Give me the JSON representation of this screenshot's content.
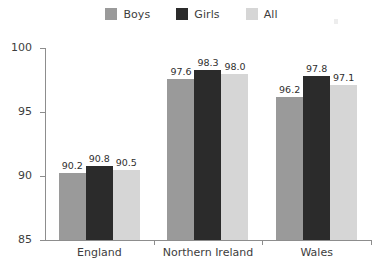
{
  "chart_data": {
    "type": "bar",
    "title": "",
    "subtitle": "",
    "xlabel": "",
    "ylabel": "",
    "categories": [
      "England",
      "Northern Ireland",
      "Wales"
    ],
    "series": [
      {
        "name": "Boys",
        "color": "#9a9a9a",
        "values": [
          90.2,
          97.6,
          96.2
        ]
      },
      {
        "name": "Girls",
        "color": "#2b2b2b",
        "values": [
          90.8,
          98.3,
          97.8
        ]
      },
      {
        "name": "All",
        "color": "#d6d6d6",
        "values": [
          90.5,
          98.0,
          97.1
        ]
      }
    ],
    "value_labels": [
      [
        "90.2",
        "90.8",
        "90.5"
      ],
      [
        "97.6",
        "98.3",
        "98.0"
      ],
      [
        "96.2",
        "97.8",
        "97.1"
      ]
    ],
    "ylim": [
      85,
      100
    ],
    "yticks": [
      85,
      90,
      95,
      100
    ],
    "ytick_labels": [
      "85",
      "90",
      "95",
      "100"
    ],
    "grid": false,
    "legend_position": "top-center",
    "axis_color": "#8d8d8d",
    "background": "#ffffff"
  },
  "legend": {
    "items": [
      {
        "label": "Boys",
        "swatch_name": "legend-swatch-boys"
      },
      {
        "label": "Girls",
        "swatch_name": "legend-swatch-girls"
      },
      {
        "label": "All",
        "swatch_name": "legend-swatch-all"
      }
    ]
  }
}
